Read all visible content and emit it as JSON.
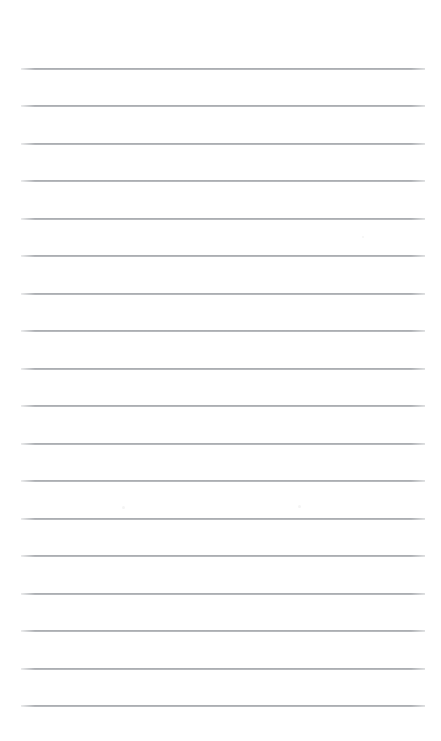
{
  "document": {
    "kind": "lined-notepaper",
    "title": "",
    "body_text": "",
    "page_background_color": "#ffffff",
    "rule_color": "#84888e",
    "rule_thickness_px": 1,
    "rule_left_px": 21,
    "rule_right_px": 425,
    "rule_width_px": 404,
    "first_rule_y_px": 68,
    "rule_spacing_px": 37.5,
    "rule_count": 18,
    "margin_rule_present": false,
    "page_width_px": 441,
    "page_height_px": 741,
    "rules": [
      {
        "index": 1,
        "y": 68
      },
      {
        "index": 2,
        "y": 105
      },
      {
        "index": 3,
        "y": 143
      },
      {
        "index": 4,
        "y": 180
      },
      {
        "index": 5,
        "y": 218
      },
      {
        "index": 6,
        "y": 255
      },
      {
        "index": 7,
        "y": 293
      },
      {
        "index": 8,
        "y": 330
      },
      {
        "index": 9,
        "y": 368
      },
      {
        "index": 10,
        "y": 405
      },
      {
        "index": 11,
        "y": 443
      },
      {
        "index": 12,
        "y": 480
      },
      {
        "index": 13,
        "y": 518
      },
      {
        "index": 14,
        "y": 555
      },
      {
        "index": 15,
        "y": 593
      },
      {
        "index": 16,
        "y": 630
      },
      {
        "index": 17,
        "y": 668
      },
      {
        "index": 18,
        "y": 705
      }
    ],
    "speckles": [
      {
        "x": 122,
        "y": 506,
        "size": 3
      },
      {
        "x": 298,
        "y": 505,
        "size": 3
      },
      {
        "x": 362,
        "y": 236,
        "size": 2
      }
    ]
  }
}
